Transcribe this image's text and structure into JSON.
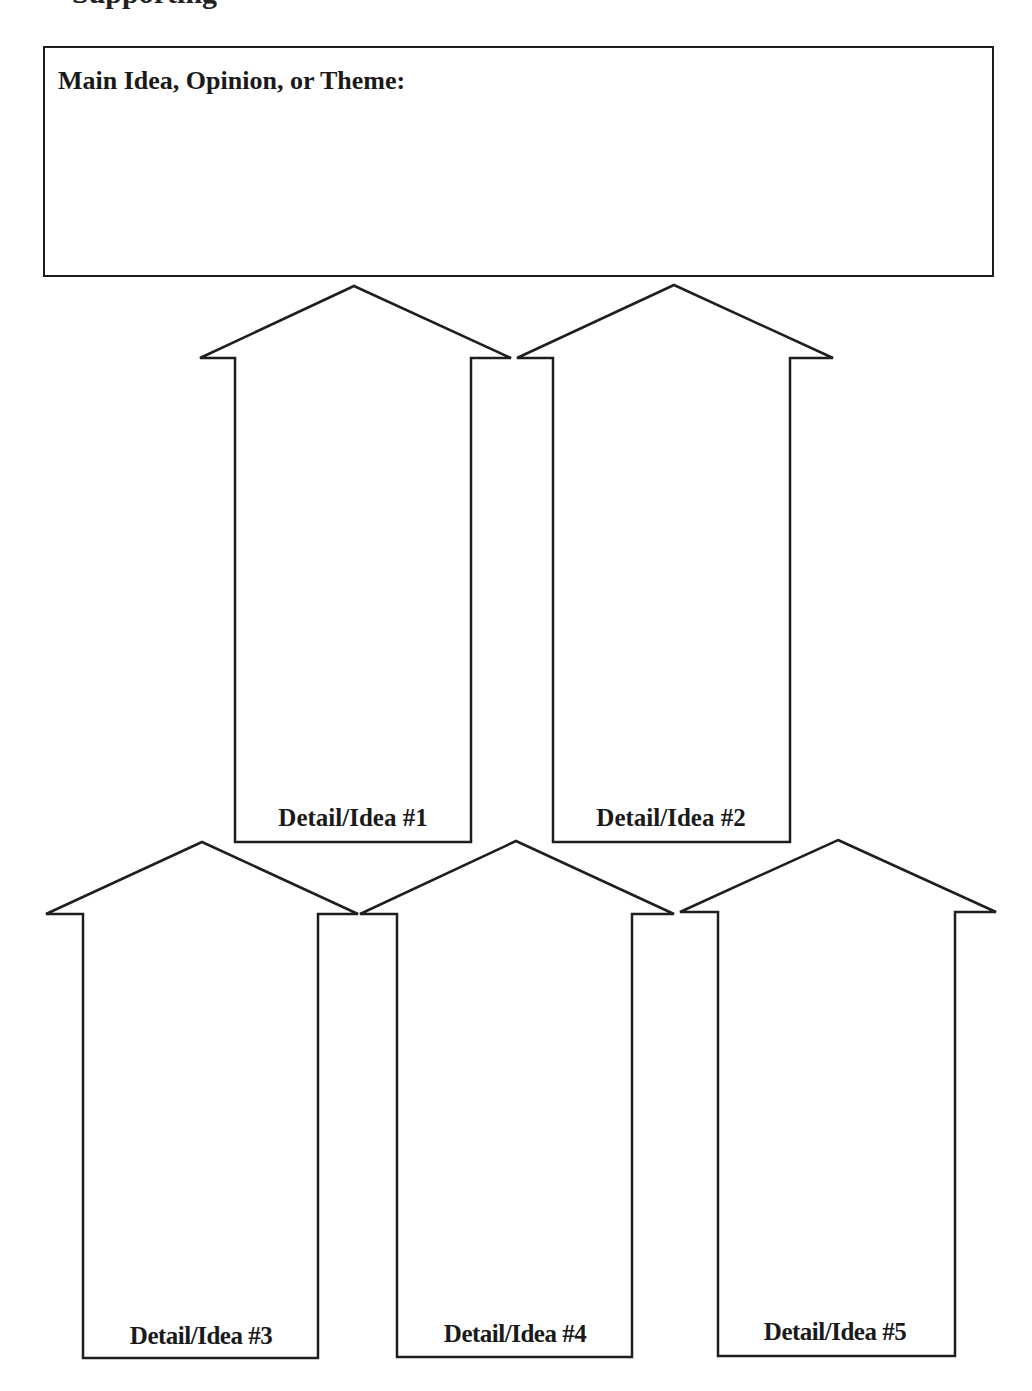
{
  "page": {
    "cut_off_heading": "Supporting"
  },
  "main_box": {
    "label": "Main Idea, Opinion, or Theme:",
    "content": ""
  },
  "arrows": [
    {
      "label": "Detail/Idea #1",
      "content": ""
    },
    {
      "label": "Detail/Idea #2",
      "content": ""
    },
    {
      "label": "Detail/Idea #3",
      "content": ""
    },
    {
      "label": "Detail/Idea #4",
      "content": ""
    },
    {
      "label": "Detail/Idea #5",
      "content": ""
    }
  ],
  "colors": {
    "stroke": "#1e1e1e",
    "background": "#ffffff",
    "text": "#1a1a1a"
  }
}
